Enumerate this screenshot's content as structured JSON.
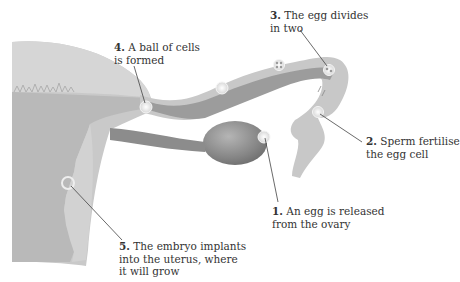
{
  "diagram": {
    "colors": {
      "uterus_outer": "#c4c4c4",
      "uterus_inner": "#d4d4d4",
      "endometrium": "#b8b8b8",
      "tube_wall": "#c8c8c8",
      "tube_lumen": "#9e9e9e",
      "ovary": "#8a8a8a",
      "cell": "#eeeeee",
      "leader_line": "#444444",
      "text": "#333333"
    },
    "labels": [
      {
        "number": "1.",
        "line1": "An egg is released",
        "line2": "from the ovary"
      },
      {
        "number": "2.",
        "line1": "Sperm fertilise",
        "line2": "the egg cell"
      },
      {
        "number": "3.",
        "line1": "The egg divides",
        "line2": "in two"
      },
      {
        "number": "4.",
        "line1": "A ball of cells",
        "line2": "is formed"
      },
      {
        "number": "5.",
        "line1": "The embryo implants",
        "line2": "into the uterus, where",
        "line3": "it will grow"
      }
    ]
  }
}
